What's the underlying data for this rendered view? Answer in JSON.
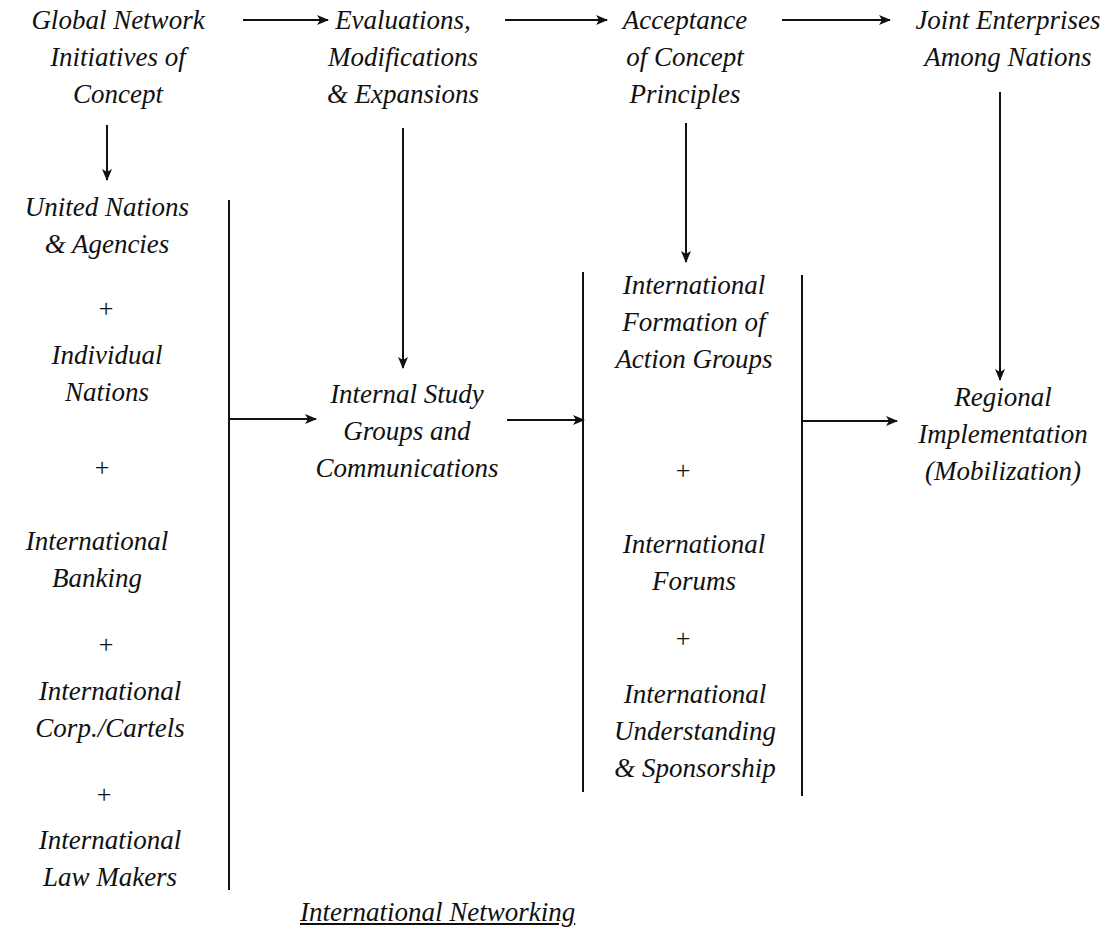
{
  "diagram": {
    "caption": "International Networking",
    "top_row": [
      {
        "id": "global",
        "lines": [
          "Global Network",
          "Initiatives of",
          "Concept"
        ]
      },
      {
        "id": "evaluations",
        "lines": [
          "Evaluations,",
          "Modifications",
          "& Expansions"
        ]
      },
      {
        "id": "acceptance",
        "lines": [
          "Acceptance",
          "of Concept",
          "Principles"
        ]
      },
      {
        "id": "joint",
        "lines": [
          "Joint Enterprises",
          "Among Nations"
        ]
      }
    ],
    "left_column": [
      {
        "lines": [
          "United Nations",
          "& Agencies"
        ]
      },
      {
        "lines": [
          "Individual",
          "Nations"
        ]
      },
      {
        "lines": [
          "International",
          "Banking"
        ]
      },
      {
        "lines": [
          "International",
          "Corp./Cartels"
        ]
      },
      {
        "lines": [
          "International",
          "Law Makers"
        ]
      }
    ],
    "middle": {
      "lines": [
        "Internal Study",
        "Groups and",
        "Communications"
      ]
    },
    "right_column": [
      {
        "lines": [
          "International",
          "Formation of",
          "Action Groups"
        ]
      },
      {
        "lines": [
          "International",
          "Forums"
        ]
      },
      {
        "lines": [
          "International",
          "Understanding",
          "& Sponsorship"
        ]
      }
    ],
    "final": {
      "lines": [
        "Regional",
        "Implementation",
        "(Mobilization)"
      ]
    },
    "plus_sign": "+",
    "line_color": "#111111"
  }
}
